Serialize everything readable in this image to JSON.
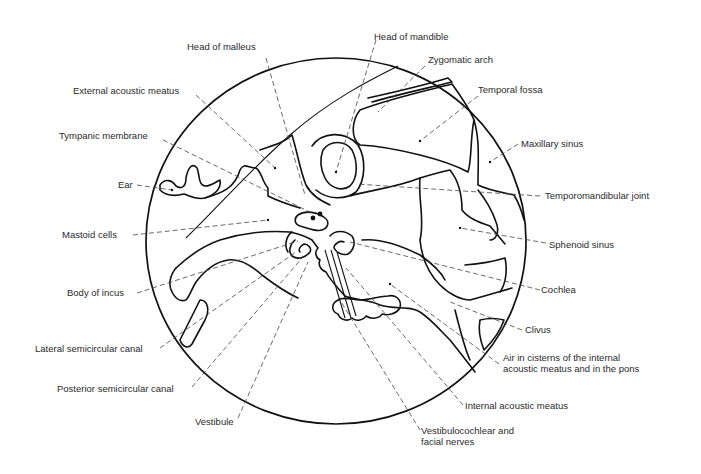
{
  "figure": {
    "type": "anatomical line diagram",
    "labels_left": [
      {
        "id": "head-of-malleus",
        "text": "Head of malleus"
      },
      {
        "id": "external-acoustic-meatus",
        "text": "External acoustic meatus"
      },
      {
        "id": "tympanic-membrane",
        "text": "Tympanic membrane"
      },
      {
        "id": "ear",
        "text": "Ear"
      },
      {
        "id": "mastoid-cells",
        "text": "Mastoid cells"
      },
      {
        "id": "body-of-incus",
        "text": "Body of incus"
      },
      {
        "id": "lateral-semicircular-canal",
        "text": "Lateral semicircular canal"
      },
      {
        "id": "posterior-semicircular-canal",
        "text": "Posterior semicircular canal"
      },
      {
        "id": "vestibule",
        "text": "Vestibule"
      }
    ],
    "labels_right": [
      {
        "id": "head-of-mandible",
        "text": "Head of mandible"
      },
      {
        "id": "zygomatic-arch",
        "text": "Zygomatic arch"
      },
      {
        "id": "temporal-fossa",
        "text": "Temporal fossa"
      },
      {
        "id": "maxillary-sinus",
        "text": "Maxillary sinus"
      },
      {
        "id": "temporomandibular-joint",
        "text": "Temporomandibular joint"
      },
      {
        "id": "sphenoid-sinus",
        "text": "Sphenoid sinus"
      },
      {
        "id": "cochlea",
        "text": "Cochlea"
      },
      {
        "id": "clivus",
        "text": "Clivus"
      },
      {
        "id": "air-in-cisterns",
        "text_line1": "Air in cisterns of the internal",
        "text_line2": "acoustic meatus and in the pons"
      },
      {
        "id": "internal-acoustic-meatus",
        "text": "Internal acoustic meatus"
      },
      {
        "id": "vestibulocochlear-facial-nerves",
        "text_line1": "Vestibulocochlear and",
        "text_line2": "facial nerves"
      }
    ]
  }
}
